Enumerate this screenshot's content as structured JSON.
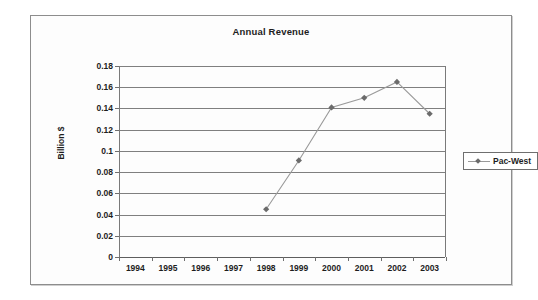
{
  "chart_data": {
    "type": "line",
    "title": "Annual Revenue",
    "xlabel": "",
    "ylabel": "Billion $",
    "categories": [
      "1994",
      "1995",
      "1996",
      "1997",
      "1998",
      "1999",
      "2000",
      "2001",
      "2002",
      "2003"
    ],
    "ylim": [
      0,
      0.18
    ],
    "yticks": [
      "0",
      "0.02",
      "0.04",
      "0.06",
      "0.08",
      "0.1",
      "0.12",
      "0.14",
      "0.16",
      "0.18"
    ],
    "ytick_values": [
      0,
      0.02,
      0.04,
      0.06,
      0.08,
      0.1,
      0.12,
      0.14,
      0.16,
      0.18
    ],
    "grid": true,
    "legend_position": "right",
    "series": [
      {
        "name": "Pac-West",
        "color": "#9a9a9a",
        "marker_color": "#6b6b6b",
        "marker": "diamond",
        "values": [
          null,
          null,
          null,
          null,
          0.045,
          0.091,
          0.141,
          0.15,
          0.165,
          0.135
        ]
      }
    ]
  },
  "legend": {
    "entries": [
      {
        "label": "Pac-West"
      }
    ]
  }
}
